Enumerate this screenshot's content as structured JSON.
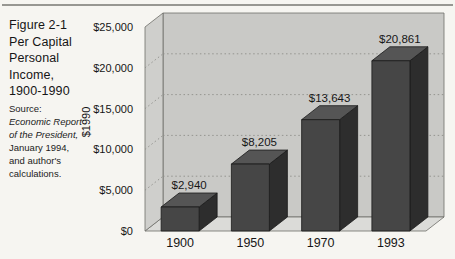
{
  "figure": {
    "title_lines": [
      "Figure 2-1",
      "Per Capital",
      "Personal",
      "Income,",
      "1900-1990"
    ],
    "source_lines": [
      "Source:",
      "Economic Report",
      "of the President,",
      "January 1994,",
      "and author's",
      "calculations."
    ]
  },
  "chart_data": {
    "type": "bar",
    "style": "3d-column",
    "categories": [
      "1900",
      "1950",
      "1970",
      "1993"
    ],
    "values": [
      2940,
      8205,
      13643,
      20861
    ],
    "value_labels": [
      "$2,940",
      "$8,205",
      "$13,643",
      "$20,861"
    ],
    "title": "Per Capital Personal Income, 1900-1990",
    "xlabel": "",
    "ylabel": "$1990",
    "ylim": [
      0,
      25000
    ],
    "ytick_interval": 5000,
    "ytick_labels": [
      "$0",
      "$5,000",
      "$10,000",
      "$15,000",
      "$20,000",
      "$25,000"
    ],
    "grid": "dotted-horizontal",
    "legend": "none",
    "colors": {
      "back_wall": "#c9c9c6",
      "left_wall": "#cfcfcc",
      "floor": "#dbdbd8",
      "wall_edge": "#6e6e6a",
      "gridline": "#8e8e8a",
      "bar_front": "#464646",
      "bar_top": "#555555",
      "bar_side": "#2d2d2d",
      "bar_edge": "#1b1b1b",
      "text": "#161616"
    }
  }
}
